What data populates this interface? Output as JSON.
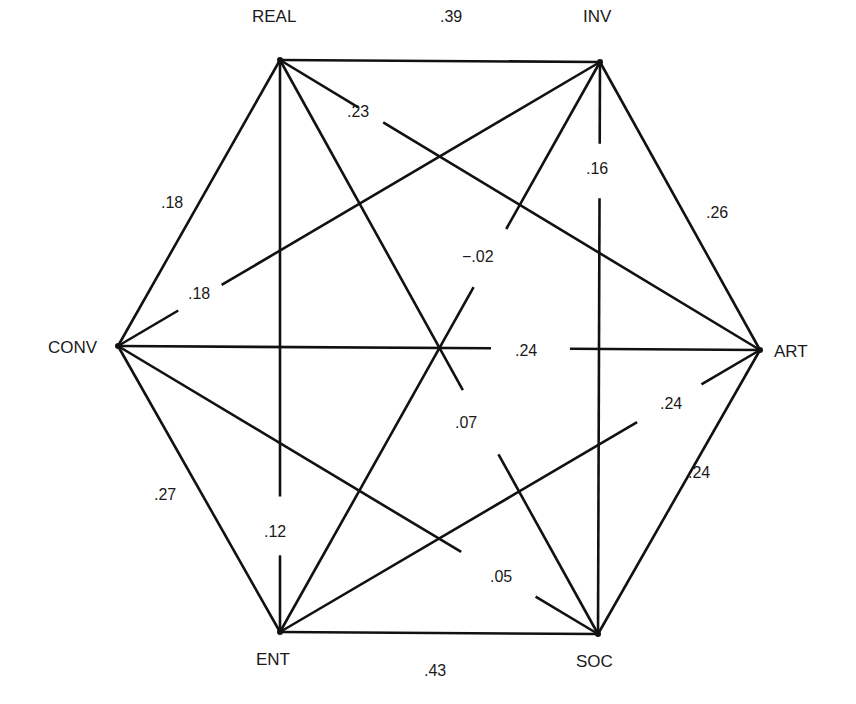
{
  "diagram": {
    "type": "hexagon correlation network",
    "nodes": [
      {
        "id": "REAL",
        "label": "REAL",
        "x": 280,
        "y": 60,
        "lx": 252,
        "ly": 22
      },
      {
        "id": "INV",
        "label": "INV",
        "x": 600,
        "y": 62,
        "lx": 583,
        "ly": 22
      },
      {
        "id": "ART",
        "label": "ART",
        "x": 760,
        "y": 350,
        "lx": 774,
        "ly": 357
      },
      {
        "id": "SOC",
        "label": "SOC",
        "x": 598,
        "y": 634,
        "lx": 576,
        "ly": 667
      },
      {
        "id": "ENT",
        "label": "ENT",
        "x": 280,
        "y": 632,
        "lx": 256,
        "ly": 665
      },
      {
        "id": "CONV",
        "label": "CONV",
        "x": 118,
        "y": 346,
        "lx": 48,
        "ly": 353
      }
    ],
    "edges": [
      {
        "from": "REAL",
        "to": "INV",
        "value": ".39",
        "lx": 440,
        "ly": 22,
        "gap": null
      },
      {
        "from": "INV",
        "to": "ART",
        "value": ".26",
        "lx": 706,
        "ly": 218,
        "gap": null
      },
      {
        "from": "ART",
        "to": "SOC",
        "value": ".24",
        "lx": 688,
        "ly": 478,
        "gap": null
      },
      {
        "from": "SOC",
        "to": "ENT",
        "value": ".43",
        "lx": 424,
        "ly": 676,
        "gap": null
      },
      {
        "from": "ENT",
        "to": "CONV",
        "value": ".27",
        "lx": 154,
        "ly": 500,
        "gap": null
      },
      {
        "from": "CONV",
        "to": "REAL",
        "value": ".18",
        "lx": 161,
        "ly": 208,
        "gap": null
      },
      {
        "from": "REAL",
        "to": "ART",
        "value": ".23",
        "lx": 347,
        "ly": 117,
        "gap": [
          0.163,
          0.215
        ]
      },
      {
        "from": "REAL",
        "to": "SOC",
        "value": ".07",
        "lx": 455,
        "ly": 428,
        "gap": [
          0.575,
          0.687
        ]
      },
      {
        "from": "REAL",
        "to": "ENT",
        "value": ".12",
        "lx": 264,
        "ly": 537,
        "gap": [
          0.763,
          0.866
        ]
      },
      {
        "from": "INV",
        "to": "CONV",
        "value": ".18",
        "lx": 188,
        "ly": 299,
        "gap": [
          0.785,
          0.875
        ]
      },
      {
        "from": "INV",
        "to": "SOC",
        "value": ".16",
        "lx": 586,
        "ly": 174,
        "gap": [
          0.143,
          0.238
        ]
      },
      {
        "from": "INV",
        "to": "ENT",
        "value": "−.02",
        "lx": 462,
        "ly": 262,
        "gap": [
          0.293,
          0.395
        ]
      },
      {
        "from": "CONV",
        "to": "ART",
        "value": ".24",
        "lx": 515,
        "ly": 356,
        "gap": [
          0.581,
          0.704
        ]
      },
      {
        "from": "CONV",
        "to": "SOC",
        "value": ".05",
        "lx": 490,
        "ly": 582,
        "gap": [
          0.715,
          0.87
        ]
      },
      {
        "from": "ART",
        "to": "ENT",
        "value": ".24",
        "lx": 660,
        "ly": 409,
        "gap": [
          0.122,
          0.256
        ]
      }
    ]
  }
}
